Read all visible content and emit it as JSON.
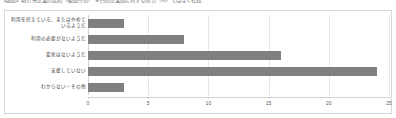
{
  "caption": {
    "text": "【図表】取引先企業の反応（複数回答）　※回答企業数に対する割合（％）ではなく社数"
  },
  "chart_data": {
    "type": "bar",
    "orientation": "horizontal",
    "title": "",
    "xlabel": "",
    "ylabel": "",
    "categories": [
      "利用を控えている、またはやめているようだ",
      "利用の必要がないようだ",
      "変化はないようだ",
      "支援していない",
      "わからない・その他"
    ],
    "values": [
      3,
      8,
      16,
      24,
      3
    ],
    "xlim": [
      0,
      25
    ],
    "xticks": [
      0,
      5,
      10,
      15,
      20,
      25
    ],
    "xtick_labels": [
      "0",
      "5",
      "10",
      "15",
      "20",
      "25"
    ],
    "grid": true,
    "legend": false,
    "bar_color": "#808080",
    "gridline_color": "#e6e6e6",
    "axis_color": "#d4d4d4",
    "plot_background": "#ffffff",
    "border_color": "#d9d9d9"
  }
}
